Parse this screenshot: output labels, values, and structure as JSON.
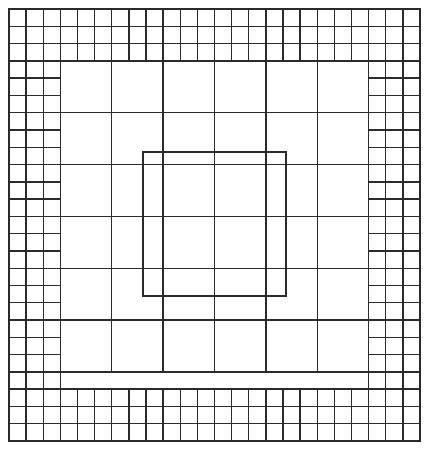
{
  "figure": {
    "type": "fractal-grid-diagram",
    "canvas": {
      "width": 428,
      "height": 449
    },
    "background_color": "#ffffff",
    "line_color": "#2b2b2b",
    "line_width": 1.4,
    "outer_frame": {
      "x": 9,
      "y": 9,
      "width": 411,
      "height": 432
    },
    "structure": {
      "description": "Concentric square rings; each ring is subdivided into cells that are three times larger than the ring outside it, producing a quadtree-like border pattern around an empty central square.",
      "ring_count": 4,
      "base_cell_size": 17.1,
      "subdivision_factor": 3,
      "band_thickness_cells": 3
    },
    "rings": [
      {
        "index": 0,
        "name": "outer-ring",
        "cell_size": 17.1,
        "cells_across": 24,
        "cells_down": 25,
        "band_cells": 3
      },
      {
        "index": 1,
        "name": "second-ring",
        "cell_size": 51.3,
        "cells_across": 6,
        "cells_down": 6,
        "band_cells": 1
      },
      {
        "index": 2,
        "name": "third-ring",
        "cell_size": 51.3,
        "cells_across": 6,
        "cells_down": 6,
        "band_cells": 1
      },
      {
        "index": 3,
        "name": "inner-ring",
        "cell_size": 51.3,
        "cells_across": 4,
        "cells_down": 4,
        "band_cells": 1
      }
    ],
    "center_square": {
      "name": "empty-center",
      "x": 143,
      "y": 152,
      "width": 143,
      "height": 144,
      "filled": false
    }
  }
}
